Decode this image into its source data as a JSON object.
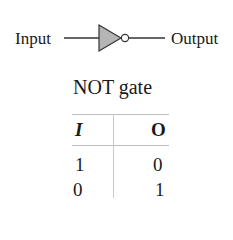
{
  "diagram": {
    "input_label": "Input",
    "output_label": "Output",
    "gate_symbol": "not-gate-icon",
    "gate_fill": "#b5b5b5"
  },
  "truth_table": {
    "title": "NOT gate",
    "headers": [
      "I",
      "O"
    ],
    "rows": [
      [
        "1",
        "0"
      ],
      [
        "0",
        "1"
      ]
    ]
  }
}
